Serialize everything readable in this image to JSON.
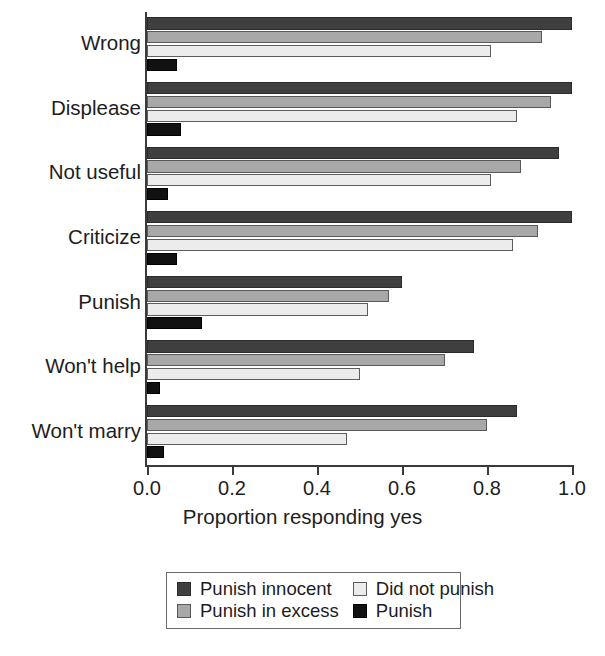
{
  "chart_data": {
    "type": "bar",
    "orientation": "horizontal",
    "title": "",
    "xlabel": "Proportion responding yes",
    "ylabel": "",
    "xlim": [
      0.0,
      1.0
    ],
    "xticks": [
      "0.0",
      "0.2",
      "0.4",
      "0.6",
      "0.8",
      "1.0"
    ],
    "xtick_values": [
      0.0,
      0.2,
      0.4,
      0.6,
      0.8,
      1.0
    ],
    "grid": false,
    "legend_position": "bottom",
    "categories": [
      "Wrong",
      "Displease",
      "Not useful",
      "Criticize",
      "Punish",
      "Won't help",
      "Won't marry"
    ],
    "series": [
      {
        "name": "Punish innocent",
        "color": "#3f3f3f",
        "values": [
          1.0,
          1.0,
          0.97,
          1.0,
          0.6,
          0.77,
          0.87
        ]
      },
      {
        "name": "Punish in excess",
        "color": "#a8a8a8",
        "values": [
          0.93,
          0.95,
          0.88,
          0.92,
          0.57,
          0.7,
          0.8
        ]
      },
      {
        "name": "Did not punish",
        "color": "#ececec",
        "values": [
          0.81,
          0.87,
          0.81,
          0.86,
          0.52,
          0.5,
          0.47
        ]
      },
      {
        "name": "Punish",
        "color": "#111111",
        "values": [
          0.07,
          0.08,
          0.05,
          0.07,
          0.13,
          0.03,
          0.04
        ]
      }
    ]
  },
  "legend": {
    "entries": [
      {
        "label": "Punish innocent",
        "series_index": 0
      },
      {
        "label": "Did not punish",
        "series_index": 2
      },
      {
        "label": "Punish in excess",
        "series_index": 1
      },
      {
        "label": "Punish",
        "series_index": 3
      }
    ]
  },
  "axis": {
    "x_title": "Proportion responding yes"
  }
}
